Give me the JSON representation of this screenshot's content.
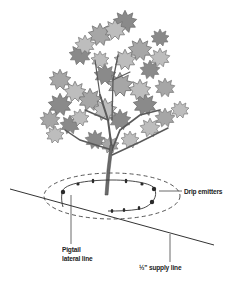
{
  "diagram": {
    "title": "",
    "labels": {
      "drip_emitters": "Drip emitters",
      "pigtail_line1": "Pigtail",
      "pigtail_line2": "lateral line",
      "supply_line": "½\" supply line"
    },
    "colors": {
      "leaf_light": "#bdbdbd",
      "leaf_mid": "#a6a6a6",
      "leaf_dark": "#8a8a8a",
      "leaf_outline": "#6e6e6e",
      "branch": "#5a5a5a",
      "line": "#333333",
      "emitter": "#2a2a2a",
      "label_text": "#222222"
    },
    "components": [
      "tree",
      "dashed drip zone ellipse",
      "pigtail lateral line loop",
      "drip emitters",
      "supply line"
    ]
  }
}
